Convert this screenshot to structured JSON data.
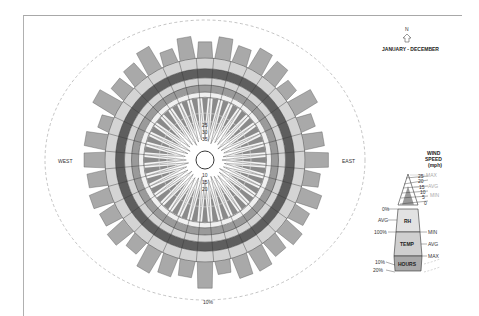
{
  "title": "JANUARY - DECEMBER",
  "north_label": "N",
  "compass": {
    "west": "WEST",
    "east": "EAST",
    "south_pct": "10%"
  },
  "colors": {
    "hours": "#a9a9a9",
    "ring_light": "#d4d4d4",
    "ring_dark": "#5e5e5e",
    "ring_mid": "#9a9a9a",
    "ring_white": "#f0f0f0",
    "wind": "#8a8a8a",
    "outline": "#333333",
    "dash": "#aaaaaa"
  },
  "wind_scale_top": [
    "25",
    "30",
    "35"
  ],
  "wind_scale_bottom": [
    "10",
    "15",
    "20"
  ],
  "legend": {
    "header": [
      "WIND",
      "SPEED",
      "(mph)"
    ],
    "wind_ticks": [
      "25",
      "20",
      "15",
      "10",
      "5",
      "0"
    ],
    "wind_right": [
      "MAX",
      "AVG",
      "MIN"
    ],
    "rh_left": [
      "0%",
      "AVG",
      "100%"
    ],
    "rh_label": "RH",
    "temp_label": "TEMP",
    "temp_right": [
      "MIN",
      "AVG",
      "MAX"
    ],
    "hours_label": "HOURS",
    "hours_left": [
      "10%",
      "20%"
    ]
  },
  "chart_data": {
    "type": "radial",
    "title": "JANUARY - DECEMBER",
    "sectors": 36,
    "layers_outer_to_inner": [
      "HOURS",
      "TEMP (MAX/AVG/MIN)",
      "RH (0%/AVG/100%)",
      "WIND SPEED (MAX/AVG/MIN)"
    ],
    "wind_speed_scale_mph": [
      0,
      5,
      10,
      15,
      20,
      25,
      30,
      35
    ],
    "hours_scale_pct": [
      10,
      20
    ],
    "directions": [
      "N",
      "EAST",
      "10%",
      "WEST"
    ]
  }
}
